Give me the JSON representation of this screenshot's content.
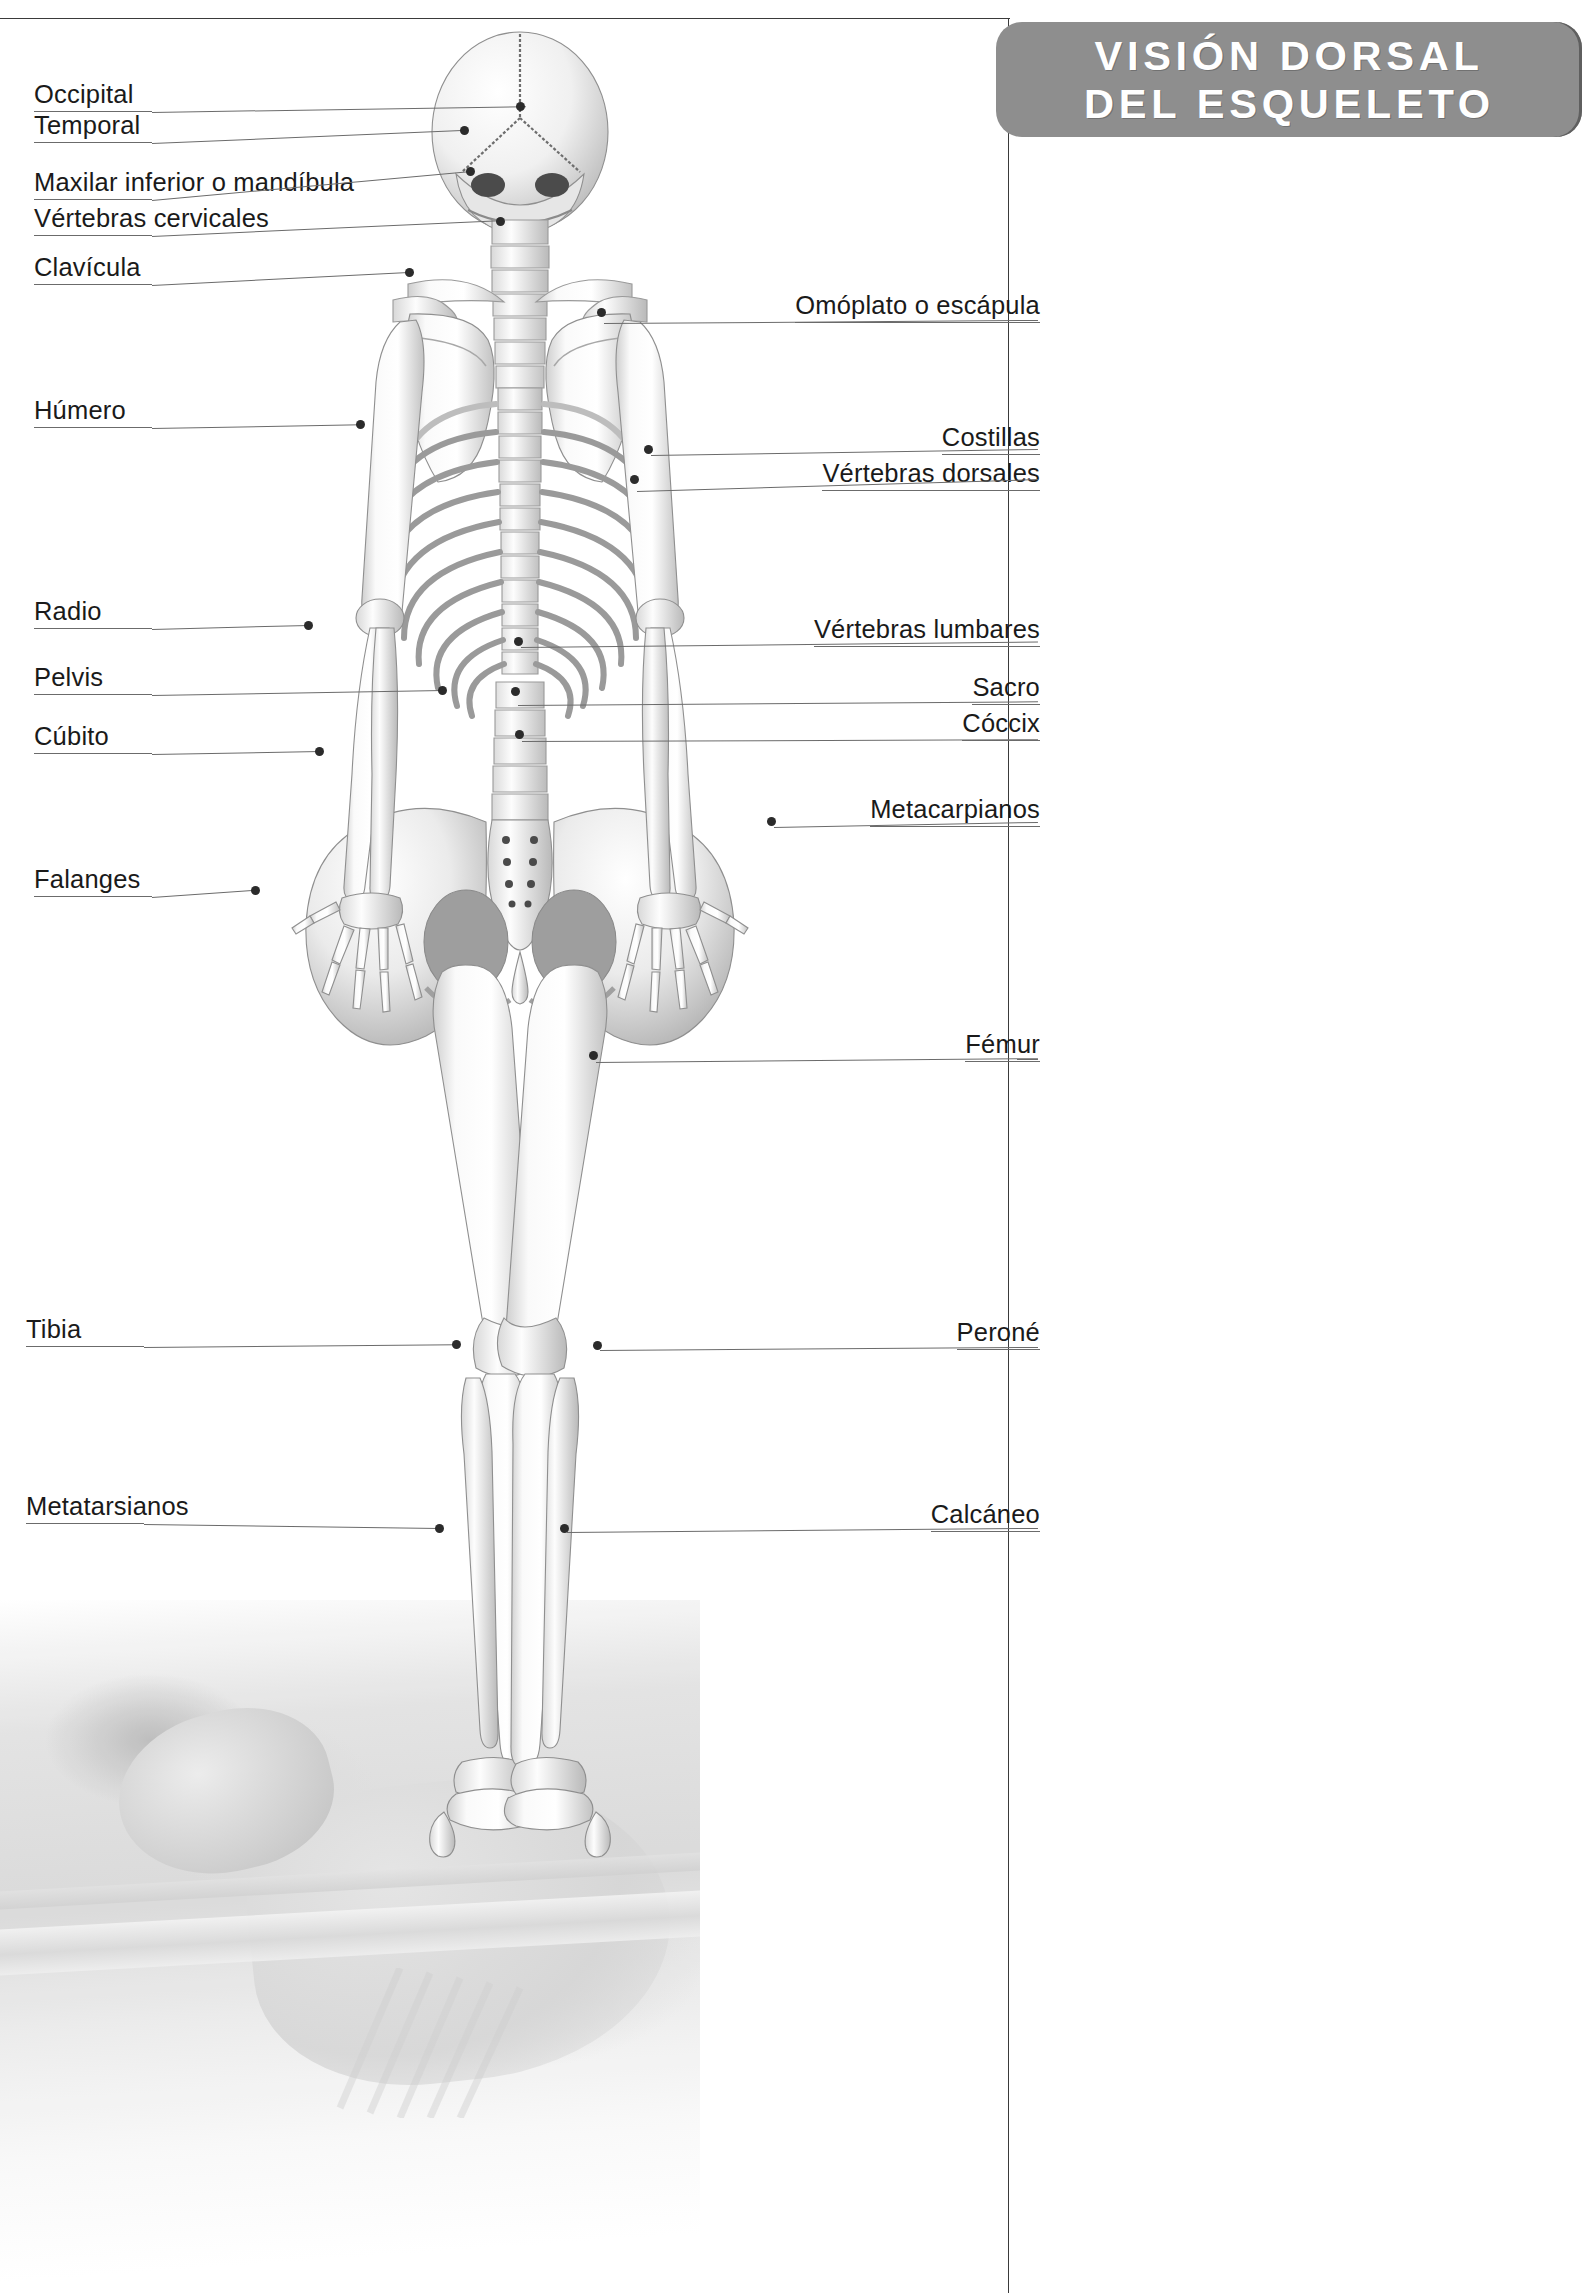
{
  "banner": {
    "line1": "VISIÓN DORSAL",
    "line2": "DEL ESQUELETO",
    "bg_color": "#8e8e8e",
    "text_color": "#ffffff"
  },
  "diagram": {
    "line_color": "#6b6b6b",
    "marker_color": "#2b2b2b",
    "label_color": "#1a1a1a"
  },
  "labels_left": [
    {
      "id": "occipital",
      "text": "Occipital",
      "x": 34,
      "y": 80,
      "line_x": 152,
      "line_y": 112,
      "line_len": 374,
      "line_angle": -0.9,
      "dot_x": 520,
      "dot_y": 106
    },
    {
      "id": "temporal",
      "text": "Temporal",
      "x": 34,
      "y": 111,
      "line_x": 152,
      "line_y": 143,
      "line_len": 316,
      "line_angle": -2.4,
      "dot_x": 464,
      "dot_y": 130
    },
    {
      "id": "mandibula",
      "text": "Maxilar inferior o mandíbula",
      "x": 34,
      "y": 168,
      "line_x": 152,
      "line_y": 200,
      "line_len": 318,
      "line_angle": -5.2,
      "dot_x": 470,
      "dot_y": 171
    },
    {
      "id": "cervicales",
      "text": "Vértebras cervicales",
      "x": 34,
      "y": 204,
      "line_x": 152,
      "line_y": 236,
      "line_len": 348,
      "line_angle": -2.6,
      "dot_x": 500,
      "dot_y": 221
    },
    {
      "id": "clavicula",
      "text": "Clavícula",
      "x": 34,
      "y": 253,
      "line_x": 152,
      "line_y": 285,
      "line_len": 262,
      "line_angle": -2.9,
      "dot_x": 409,
      "dot_y": 272
    },
    {
      "id": "humero",
      "text": "Húmero",
      "x": 34,
      "y": 396,
      "line_x": 152,
      "line_y": 428,
      "line_len": 209,
      "line_angle": -1.0,
      "dot_x": 360,
      "dot_y": 424
    },
    {
      "id": "radio",
      "text": "Radio",
      "x": 34,
      "y": 597,
      "line_x": 152,
      "line_y": 629,
      "line_len": 157,
      "line_angle": -1.5,
      "dot_x": 308,
      "dot_y": 625
    },
    {
      "id": "pelvis",
      "text": "Pelvis",
      "x": 34,
      "y": 663,
      "line_x": 152,
      "line_y": 695,
      "line_len": 291,
      "line_angle": -1.0,
      "dot_x": 442,
      "dot_y": 690
    },
    {
      "id": "cubito",
      "text": "Cúbito",
      "x": 34,
      "y": 722,
      "line_x": 152,
      "line_y": 754,
      "line_len": 168,
      "line_angle": -1.0,
      "dot_x": 319,
      "dot_y": 751
    },
    {
      "id": "falanges",
      "text": "Falanges",
      "x": 34,
      "y": 865,
      "line_x": 152,
      "line_y": 897,
      "line_len": 104,
      "line_angle": -4.0,
      "dot_x": 255,
      "dot_y": 890
    },
    {
      "id": "tibia",
      "text": "Tibia",
      "x": 26,
      "y": 1315,
      "line_x": 144,
      "line_y": 1347,
      "line_len": 313,
      "line_angle": -0.5,
      "dot_x": 456,
      "dot_y": 1344
    },
    {
      "id": "metatarsianos",
      "text": "Metatarsianos",
      "x": 26,
      "y": 1492,
      "line_x": 144,
      "line_y": 1524,
      "line_len": 295,
      "line_angle": 0.8,
      "dot_x": 439,
      "dot_y": 1528
    }
  ],
  "labels_right": [
    {
      "id": "omoplato",
      "text": "Omóplato o escápula",
      "x": 1040,
      "y": 291,
      "line_x": 604,
      "line_y": 323,
      "line_len": 434,
      "line_angle": -0.4,
      "dot_x": 601,
      "dot_y": 312
    },
    {
      "id": "costillas",
      "text": "Costillas",
      "x": 1040,
      "y": 423,
      "line_x": 651,
      "line_y": 455,
      "line_len": 387,
      "line_angle": -0.9,
      "dot_x": 648,
      "dot_y": 449
    },
    {
      "id": "dorsales",
      "text": "Vértebras dorsales",
      "x": 1040,
      "y": 459,
      "line_x": 637,
      "line_y": 491,
      "line_len": 401,
      "line_angle": -1.7,
      "dot_x": 634,
      "dot_y": 479
    },
    {
      "id": "lumbares",
      "text": "Vértebras lumbares",
      "x": 1040,
      "y": 615,
      "line_x": 521,
      "line_y": 647,
      "line_len": 517,
      "line_angle": -0.6,
      "dot_x": 518,
      "dot_y": 641
    },
    {
      "id": "sacro",
      "text": "Sacro",
      "x": 1040,
      "y": 673,
      "line_x": 518,
      "line_y": 705,
      "line_len": 520,
      "line_angle": -0.4,
      "dot_x": 515,
      "dot_y": 691
    },
    {
      "id": "coccix",
      "text": "Cóccix",
      "x": 1040,
      "y": 709,
      "line_x": 522,
      "line_y": 741,
      "line_len": 516,
      "line_angle": -0.2,
      "dot_x": 519,
      "dot_y": 734
    },
    {
      "id": "metacarpianos",
      "text": "Metacarpianos",
      "x": 1040,
      "y": 795,
      "line_x": 774,
      "line_y": 827,
      "line_len": 264,
      "line_angle": -1.1,
      "dot_x": 771,
      "dot_y": 821
    },
    {
      "id": "femur",
      "text": "Fémur",
      "x": 1040,
      "y": 1030,
      "line_x": 596,
      "line_y": 1062,
      "line_len": 442,
      "line_angle": -0.5,
      "dot_x": 593,
      "dot_y": 1055
    },
    {
      "id": "perone",
      "text": "Peroné",
      "x": 1040,
      "y": 1318,
      "line_x": 600,
      "line_y": 1350,
      "line_len": 438,
      "line_angle": -0.4,
      "dot_x": 597,
      "dot_y": 1345
    },
    {
      "id": "calcaneo",
      "text": "Calcáneo",
      "x": 1040,
      "y": 1500,
      "line_x": 567,
      "line_y": 1532,
      "line_len": 471,
      "line_angle": -0.5,
      "dot_x": 564,
      "dot_y": 1528
    }
  ]
}
